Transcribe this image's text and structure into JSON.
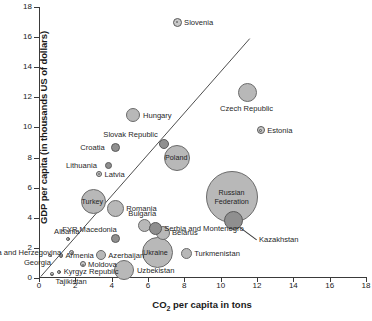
{
  "chart_data": {
    "type": "scatter",
    "title": "",
    "xlabel": "CO2 per capita in tons",
    "ylabel": "GDP per capita (in thousands US of dollars)",
    "xlim": [
      0,
      18
    ],
    "ylim": [
      0,
      18
    ],
    "xticks": [
      0,
      2,
      4,
      6,
      8,
      10,
      12,
      14,
      16,
      18
    ],
    "yticks": [
      0,
      2,
      4,
      6,
      8,
      10,
      12,
      14,
      16,
      18
    ],
    "grid": false,
    "legend": "none",
    "annotations": [
      {
        "name": "trend-line",
        "type": "line",
        "from": [
          0.1,
          0.1
        ],
        "to": [
          11.6,
          15.9
        ]
      }
    ],
    "points": [
      {
        "label": "Slovenia",
        "x": 7.6,
        "y": 17.0,
        "r": 4.5,
        "style": "ring",
        "label_pos": "right"
      },
      {
        "label": "Czech Republic",
        "x": 11.5,
        "y": 12.3,
        "r": 9.5,
        "style": "light",
        "label_pos": "below"
      },
      {
        "label": "Estonia",
        "x": 12.2,
        "y": 9.8,
        "r": 4.0,
        "style": "ring",
        "label_pos": "right"
      },
      {
        "label": "Hungary",
        "x": 5.2,
        "y": 10.8,
        "r": 7.0,
        "style": "light",
        "label_pos": "right"
      },
      {
        "label": "Slovak Republic",
        "x": 6.9,
        "y": 8.9,
        "r": 5.0,
        "style": "dark",
        "label_pos": "above-left"
      },
      {
        "label": "Croatia",
        "x": 4.2,
        "y": 8.7,
        "r": 4.5,
        "style": "dark",
        "label_pos": "left"
      },
      {
        "label": "Poland",
        "x": 7.6,
        "y": 8.0,
        "r": 13.0,
        "style": "light",
        "label_pos": "inside"
      },
      {
        "label": "Lithuania",
        "x": 3.8,
        "y": 7.5,
        "r": 3.5,
        "style": "dark",
        "label_pos": "left"
      },
      {
        "label": "Latvia",
        "x": 3.3,
        "y": 6.9,
        "r": 3.0,
        "style": "ring",
        "label_pos": "right"
      },
      {
        "label": "Russian Federation",
        "x": 10.6,
        "y": 5.4,
        "r": 26.0,
        "style": "light",
        "label_pos": "inside"
      },
      {
        "label": "Turkey",
        "x": 3.0,
        "y": 5.1,
        "r": 12.5,
        "style": "light",
        "label_pos": "inside"
      },
      {
        "label": "Romania",
        "x": 4.2,
        "y": 4.6,
        "r": 8.5,
        "style": "light",
        "label_pos": "right"
      },
      {
        "label": "Kazakhstan",
        "x": 10.7,
        "y": 3.8,
        "r": 9.5,
        "style": "dark",
        "label_pos": "leader-right"
      },
      {
        "label": "Bulgaria",
        "x": 5.8,
        "y": 3.5,
        "r": 6.5,
        "style": "light",
        "label_pos": "above"
      },
      {
        "label": "Serbia and Montenegro",
        "x": 6.4,
        "y": 3.3,
        "r": 6.5,
        "style": "dark",
        "label_pos": "right"
      },
      {
        "label": "Belarus",
        "x": 6.8,
        "y": 3.0,
        "r": 7.0,
        "style": "light",
        "label_pos": "right"
      },
      {
        "label": "Albania",
        "x": 1.6,
        "y": 2.6,
        "r": 2.2,
        "style": "ring",
        "label_pos": "above"
      },
      {
        "label": "FYR Macedonia",
        "x": 4.2,
        "y": 2.6,
        "r": 4.5,
        "style": "dark",
        "label_pos": "above-left"
      },
      {
        "label": "Bosnia and Herzegovina",
        "x": 1.8,
        "y": 1.7,
        "r": 2.8,
        "style": "ring",
        "label_pos": "left"
      },
      {
        "label": "Ukraine",
        "x": 6.5,
        "y": 1.7,
        "r": 15.5,
        "style": "light",
        "label_pos": "inside"
      },
      {
        "label": "Armenia",
        "x": 1.2,
        "y": 1.5,
        "r": 2.2,
        "style": "ring",
        "label_pos": "right"
      },
      {
        "label": "Azerbaijan",
        "x": 3.4,
        "y": 1.5,
        "r": 5.0,
        "style": "light",
        "label_pos": "right"
      },
      {
        "label": "Turkmenistan",
        "x": 8.1,
        "y": 1.6,
        "r": 5.5,
        "style": "light",
        "label_pos": "right"
      },
      {
        "label": "Georgia",
        "x": 0.6,
        "y": 1.5,
        "r": 1.8,
        "style": "ring",
        "label_pos": "below-left"
      },
      {
        "label": "Moldova",
        "x": 2.4,
        "y": 0.9,
        "r": 3.0,
        "style": "ring",
        "label_pos": "right"
      },
      {
        "label": "Uzbekistan",
        "x": 4.7,
        "y": 0.5,
        "r": 10.0,
        "style": "light",
        "label_pos": "right"
      },
      {
        "label": "Kyrgyz Republic",
        "x": 1.1,
        "y": 0.4,
        "r": 2.2,
        "style": "ring",
        "label_pos": "right"
      },
      {
        "label": "Tajikistan",
        "x": 0.7,
        "y": 0.25,
        "r": 1.8,
        "style": "ring",
        "label_pos": "below-right"
      }
    ]
  },
  "axes": {
    "x_title_main": "CO",
    "x_title_sub": "2",
    "x_title_rest": " per capita in tons",
    "y_title": "GDP per capita (in thousands US of dollars)"
  },
  "colors": {
    "bubble_light": "#b8b8b8",
    "bubble_dark": "#8f8f8f",
    "axis": "#3a3a3a",
    "text": "#1a1a1a",
    "background": "#ffffff"
  }
}
